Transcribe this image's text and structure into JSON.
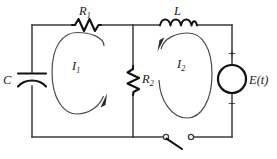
{
  "figure": {
    "type": "electrical-schematic"
  },
  "components": {
    "capacitor": {
      "label": "C",
      "name": "capacitor-C",
      "position": "left-branch"
    },
    "resistor1": {
      "label": "R",
      "subscript": "1",
      "name": "resistor-R1",
      "position": "top-left-rail"
    },
    "resistor2": {
      "label": "R",
      "subscript": "2",
      "name": "resistor-R2",
      "position": "middle-branch"
    },
    "inductor": {
      "label": "L",
      "name": "inductor-L",
      "position": "top-right-rail"
    },
    "source": {
      "label": "E(t)",
      "name": "voltage-source",
      "position": "right-branch",
      "plus": "+",
      "minus": "−"
    },
    "switch": {
      "label": "",
      "name": "switch",
      "state": "open",
      "position": "bottom-right-rail"
    }
  },
  "mesh_currents": [
    {
      "label": "I",
      "subscript": "1",
      "name": "mesh-current-I1",
      "direction": "clockwise"
    },
    {
      "label": "I",
      "subscript": "2",
      "name": "mesh-current-I2",
      "direction": "counterclockwise"
    }
  ],
  "colors": {
    "wire": "#3c3c3c",
    "component": "#111111",
    "loop": "#4a4a4a",
    "background": "#ffffff",
    "text": "#1a1a1a"
  }
}
